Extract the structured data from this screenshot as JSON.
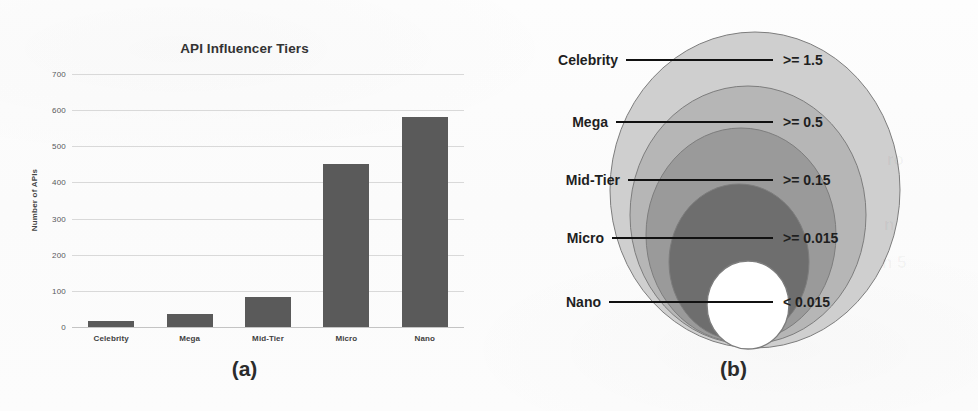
{
  "figure": {
    "panel_a_caption": "(a)",
    "panel_b_caption": "(b)"
  },
  "chart_data": [
    {
      "type": "bar",
      "title": "API Influencer Tiers",
      "xlabel": "",
      "ylabel": "Number of APIs",
      "categories": [
        "Celebrity",
        "Mega",
        "Mid-Tier",
        "Micro",
        "Nano"
      ],
      "values": [
        18,
        37,
        82,
        450,
        582
      ],
      "ylim": [
        0,
        700
      ],
      "yticks": [
        0,
        100,
        200,
        300,
        400,
        500,
        600,
        700
      ],
      "ytick_labels": [
        "0",
        "100",
        "200",
        "300",
        "400",
        "500",
        "600",
        "700"
      ],
      "grid": true,
      "legend": "none",
      "bar_color": "#5a5a5a",
      "gridline_color": "#d9d9d9"
    },
    {
      "type": "venn-nested",
      "title": "",
      "note": "Nested tier circles, each inner tier contained by the outer tier",
      "tiers": [
        {
          "label": "Celebrity",
          "value": ">= 1.5",
          "fill": "#cfcfcf"
        },
        {
          "label": "Mega",
          "value": ">= 0.5",
          "fill": "#b6b6b6"
        },
        {
          "label": "Mid-Tier",
          "value": ">= 0.15",
          "fill": "#9a9a9a"
        },
        {
          "label": "Micro",
          "value": ">= 0.015",
          "fill": "#6e6e6e"
        },
        {
          "label": "Nano",
          "value": "< 0.015",
          "fill": "#ffffff"
        }
      ]
    }
  ]
}
